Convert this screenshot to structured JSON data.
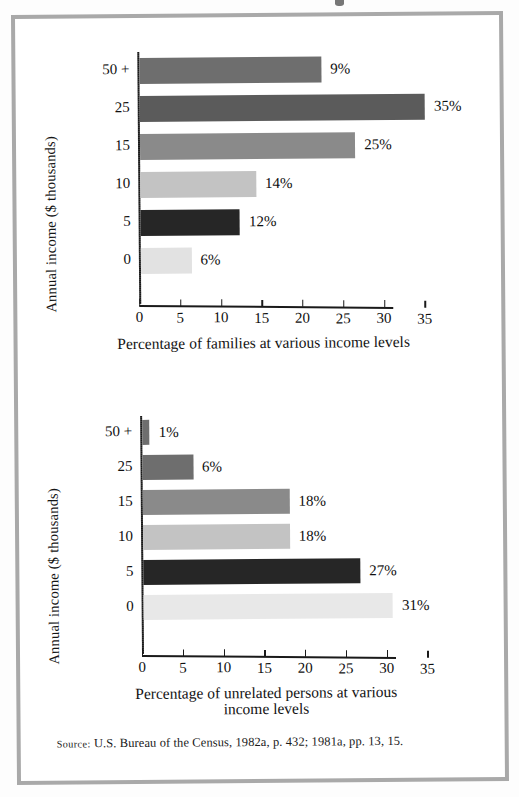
{
  "figure": {
    "source_prefix": "Source:",
    "source_text": "U.S. Bureau of the Census, 1982a, p. 432; 1981a, pp. 13, 15."
  },
  "palette": {
    "bar_dark_gray": "#6e6e6e",
    "bar_darker_gray": "#5b5b5b",
    "bar_mid_gray": "#8a8a8a",
    "bar_light_gray": "#c3c3c3",
    "bar_black": "#262626",
    "bar_pale_gray": "#e2e2e2",
    "axis": "#1a1a1a",
    "frame": "#a9a9a9"
  },
  "chart_data": [
    {
      "type": "bar",
      "orientation": "horizontal",
      "id": "families",
      "title": "",
      "ylabel": "Annual income ($ thousands)",
      "xlabel": "Percentage of families at various income levels",
      "xlim": [
        0,
        38
      ],
      "xticks": [
        0,
        5,
        10,
        15,
        20,
        25,
        30,
        35
      ],
      "xtick_labels": [
        "0",
        "5",
        "10",
        "15",
        "20",
        "25",
        "30",
        "35"
      ],
      "grid": false,
      "legend": "none",
      "categories": [
        "50 +",
        "25",
        "15",
        "10",
        "5",
        "0"
      ],
      "values": [
        9,
        35,
        25,
        14,
        12,
        6
      ],
      "data_labels": [
        "9%",
        "35%",
        "25%",
        "14%",
        "12%",
        "6%"
      ],
      "drawn_lengths": [
        22.3,
        35.0,
        26.4,
        14.2,
        12.2,
        6.2
      ],
      "bar_colors": [
        "#6e6e6e",
        "#5b5b5b",
        "#8a8a8a",
        "#c3c3c3",
        "#262626",
        "#e2e2e2"
      ]
    },
    {
      "type": "bar",
      "orientation": "horizontal",
      "id": "unrelated-persons",
      "title": "",
      "ylabel": "Annual income ($ thousands)",
      "xlabel": "Percentage of unrelated persons at various\nincome levels",
      "xlim": [
        0,
        38
      ],
      "xticks": [
        0,
        5,
        10,
        15,
        20,
        25,
        30,
        35
      ],
      "xtick_labels": [
        "0",
        "5",
        "10",
        "15",
        "20",
        "25",
        "30",
        "35"
      ],
      "grid": false,
      "legend": "none",
      "categories": [
        "50 +",
        "25",
        "15",
        "10",
        "5",
        "0"
      ],
      "values": [
        1,
        6,
        18,
        18,
        27,
        31
      ],
      "data_labels": [
        "1%",
        "6%",
        "18%",
        "18%",
        "27%",
        "31%"
      ],
      "drawn_lengths": [
        0.9,
        6.2,
        18.0,
        18.0,
        26.6,
        30.6
      ],
      "bar_colors": [
        "#6e6e6e",
        "#6e6e6e",
        "#8a8a8a",
        "#c3c3c3",
        "#262626",
        "#e8e8e8"
      ]
    }
  ]
}
